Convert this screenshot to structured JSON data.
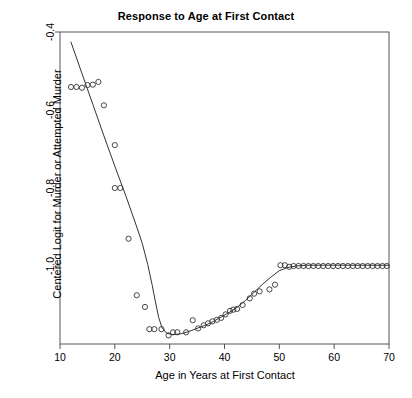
{
  "chart_data": {
    "type": "scatter",
    "title": "Response to Age at First Contact",
    "xlabel": "Age in Years at First Contact",
    "ylabel": "Centered Logit for Murder or Attempted Murder",
    "xlim": [
      10,
      70
    ],
    "ylim": [
      -1.2,
      -0.4
    ],
    "grid": false,
    "legend": null,
    "xticks": [
      10,
      20,
      30,
      40,
      50,
      60,
      70
    ],
    "xtick_labels": [
      "10",
      "20",
      "30",
      "40",
      "50",
      "60",
      "70"
    ],
    "yticks": [
      -0.4,
      -0.6,
      -0.8,
      -1.0
    ],
    "ytick_labels": [
      "-0.4",
      "-0.6",
      "-0.8",
      "-1.0"
    ],
    "point_style": "open-circle",
    "point_color": "#333333",
    "line_color": "#333333",
    "series": [
      {
        "name": "observed",
        "type": "scatter",
        "x": [
          12,
          13,
          14,
          15,
          16,
          17,
          18,
          20,
          20,
          21,
          22.5,
          24,
          25.5,
          26.3,
          27.2,
          28.5,
          29.8,
          30.6,
          31.4,
          33,
          34.2,
          35.2,
          36.2,
          37,
          37.8,
          38.6,
          39.4,
          40.2,
          41,
          41.6,
          42.3,
          43.3,
          44.6,
          45.4,
          46.4,
          48.2,
          49.2,
          50.2,
          51,
          51.8,
          52.6,
          53.5,
          54.4,
          55.3,
          56.2,
          57.1,
          58,
          58.9,
          59.8,
          60.7,
          61.6,
          62.5,
          63.4,
          64.3,
          65.2,
          66.1,
          67,
          67.9,
          68.8,
          69.6
        ],
        "y": [
          -0.541,
          -0.541,
          -0.543,
          -0.536,
          -0.535,
          -0.528,
          -0.588,
          -0.69,
          -0.8,
          -0.8,
          -0.93,
          -1.075,
          -1.105,
          -1.162,
          -1.162,
          -1.162,
          -1.178,
          -1.17,
          -1.17,
          -1.17,
          -1.139,
          -1.16,
          -1.152,
          -1.147,
          -1.142,
          -1.138,
          -1.133,
          -1.124,
          -1.115,
          -1.112,
          -1.11,
          -1.1,
          -1.083,
          -1.071,
          -1.065,
          -1.06,
          -1.048,
          -0.998,
          -0.998,
          -1.002,
          -1.0,
          -1.0,
          -1.0,
          -1.0,
          -1.0,
          -1.0,
          -1.0,
          -1.0,
          -1.0,
          -1.0,
          -1.0,
          -1.0,
          -1.0,
          -1.0,
          -1.0,
          -1.0,
          -1.0,
          -1.0,
          -1.0,
          -1.0
        ]
      },
      {
        "name": "smooth-fit",
        "type": "line",
        "x": [
          12,
          14,
          16,
          18,
          20,
          22,
          24,
          25,
          26,
          26.8,
          27.4,
          28,
          28.6,
          29.4,
          30.5,
          32,
          33.5,
          35,
          36.5,
          38,
          39.5,
          41,
          42.5,
          44,
          45.5,
          47,
          48.5,
          50,
          51.5,
          53,
          55,
          58,
          62,
          66,
          70
        ],
        "y": [
          -0.426,
          -0.506,
          -0.586,
          -0.666,
          -0.744,
          -0.82,
          -0.9,
          -0.942,
          -0.996,
          -1.048,
          -1.092,
          -1.132,
          -1.158,
          -1.172,
          -1.176,
          -1.174,
          -1.168,
          -1.16,
          -1.152,
          -1.142,
          -1.13,
          -1.118,
          -1.104,
          -1.086,
          -1.066,
          -1.046,
          -1.028,
          -1.012,
          -1.004,
          -1.0,
          -0.998,
          -0.998,
          -0.998,
          -0.998,
          -0.998
        ]
      }
    ]
  },
  "axes": {
    "box_left_px": 60,
    "box_right_px": 389,
    "box_top_px": 32,
    "box_bottom_px": 344
  }
}
